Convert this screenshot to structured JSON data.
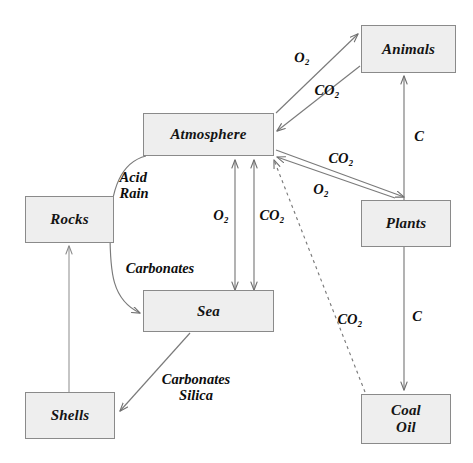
{
  "diagram": {
    "colors": {
      "box_fill": "#eeeeee",
      "box_border": "#8a8a8a",
      "arrow": "#7a7a7a",
      "text": "#141414",
      "background": "#ffffff"
    },
    "nodes": [
      {
        "id": "animals",
        "label": "Animals",
        "x": 361,
        "y": 25,
        "w": 95,
        "h": 48
      },
      {
        "id": "atmosphere",
        "label": "Atmosphere",
        "x": 143,
        "y": 113,
        "w": 131,
        "h": 43
      },
      {
        "id": "plants",
        "label": "Plants",
        "x": 361,
        "y": 200,
        "w": 90,
        "h": 47
      },
      {
        "id": "rocks",
        "label": "Rocks",
        "x": 25,
        "y": 196,
        "w": 89,
        "h": 47
      },
      {
        "id": "sea",
        "label": "Sea",
        "x": 143,
        "y": 290,
        "w": 131,
        "h": 42
      },
      {
        "id": "shells",
        "label": "Shells",
        "x": 25,
        "y": 392,
        "w": 90,
        "h": 47
      },
      {
        "id": "coaloil",
        "label": "Coal\nOil",
        "x": 361,
        "y": 394,
        "w": 90,
        "h": 50
      }
    ],
    "edges": [
      {
        "id": "atmosphere-to-animals-o2",
        "from": "atmosphere",
        "to": "animals",
        "label": "O₂",
        "label_x": 302,
        "label_y": 58,
        "style": "solid",
        "arrow": "forward"
      },
      {
        "id": "animals-to-atmosphere-co2",
        "from": "animals",
        "to": "atmosphere",
        "label": "CO₂",
        "label_x": 327,
        "label_y": 91,
        "style": "solid",
        "arrow": "forward"
      },
      {
        "id": "plants-to-atmosphere-co2",
        "from": "plants",
        "to": "atmosphere",
        "label": "CO₂",
        "label_x": 341,
        "label_y": 159,
        "style": "solid",
        "arrow": "forward"
      },
      {
        "id": "atmosphere-to-plants-o2",
        "from": "atmosphere",
        "to": "plants",
        "label": "O₂",
        "label_x": 321,
        "label_y": 190,
        "style": "solid",
        "arrow": "forward"
      },
      {
        "id": "plants-to-animals-c",
        "from": "plants",
        "to": "animals",
        "label": "C",
        "label_x": 419,
        "label_y": 137,
        "style": "solid",
        "arrow": "forward"
      },
      {
        "id": "plants-to-coaloil-c",
        "from": "plants",
        "to": "coaloil",
        "label": "C",
        "label_x": 417,
        "label_y": 317,
        "style": "solid",
        "arrow": "forward"
      },
      {
        "id": "coaloil-to-atmosphere-co2",
        "from": "coaloil",
        "to": "atmosphere",
        "label": "CO₂",
        "label_x": 350,
        "label_y": 320,
        "style": "dashed",
        "arrow": "forward"
      },
      {
        "id": "atmosphere-sea-o2",
        "from": "atmosphere",
        "to": "sea",
        "label": "O₂",
        "label_x": 221,
        "label_y": 216,
        "style": "solid",
        "arrow": "both"
      },
      {
        "id": "atmosphere-sea-co2",
        "from": "sea",
        "to": "atmosphere",
        "label": "CO₂",
        "label_x": 272,
        "label_y": 216,
        "style": "solid",
        "arrow": "both"
      },
      {
        "id": "atmosphere-to-sea-acid-rain",
        "from": "atmosphere",
        "to": "sea",
        "label": "Acid\nRain",
        "label_x": 134,
        "label_y": 186,
        "style": "solid",
        "arrow": "forward"
      },
      {
        "id": "carbonates-curve-label",
        "from": "atmosphere",
        "to": "sea",
        "label": "Carbonates",
        "label_x": 160,
        "label_y": 269,
        "style": "solid",
        "arrow": "none"
      },
      {
        "id": "sea-to-shells-carbonates-silica",
        "from": "sea",
        "to": "shells",
        "label": "Carbonates\nSilica",
        "label_x": 196,
        "label_y": 388,
        "style": "solid",
        "arrow": "forward"
      },
      {
        "id": "shells-to-rocks",
        "from": "shells",
        "to": "rocks",
        "label": "",
        "label_x": 0,
        "label_y": 0,
        "style": "solid",
        "arrow": "forward"
      }
    ]
  }
}
